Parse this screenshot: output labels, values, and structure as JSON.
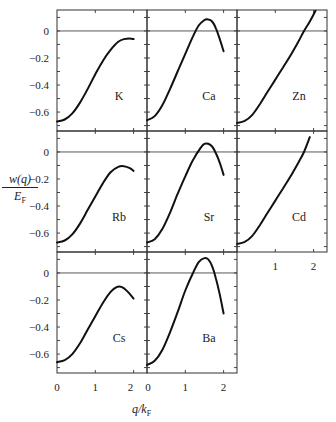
{
  "chart_data": {
    "type": "line",
    "layout": "small-multiples grid (3 columns x 3 rows, Cs and Ba in bottom row, Zn/Cd in third column)",
    "ylabel_num": "w(q)",
    "ylabel_den_main": "E",
    "ylabel_den_sub": "F",
    "xlabel_main": "q/k",
    "xlabel_sub": "F",
    "xlim": [
      0,
      2.35
    ],
    "ylim": [
      -0.74,
      0.155
    ],
    "yticks": [
      0,
      -0.2,
      -0.4,
      -0.6
    ],
    "ytick_labels": [
      "0",
      "−0.2",
      "−0.4",
      "−0.6"
    ],
    "xticks": [
      0,
      1,
      2
    ],
    "xtick_labels": [
      "0",
      "1",
      "2"
    ],
    "zero_line": true,
    "panels": [
      {
        "label": "K",
        "row": 0,
        "col": 0,
        "x": [
          0,
          0.2,
          0.4,
          0.6,
          0.8,
          1.0,
          1.2,
          1.4,
          1.6,
          1.75,
          1.9,
          2.0
        ],
        "y": [
          -0.67,
          -0.655,
          -0.61,
          -0.53,
          -0.43,
          -0.32,
          -0.22,
          -0.14,
          -0.08,
          -0.06,
          -0.055,
          -0.06
        ]
      },
      {
        "label": "Ca",
        "row": 0,
        "col": 1,
        "x": [
          0,
          0.2,
          0.4,
          0.6,
          0.8,
          1.0,
          1.2,
          1.35,
          1.5,
          1.6,
          1.7,
          1.8,
          1.9,
          2.0
        ],
        "y": [
          -0.66,
          -0.63,
          -0.55,
          -0.43,
          -0.3,
          -0.17,
          -0.04,
          0.04,
          0.08,
          0.085,
          0.07,
          0.02,
          -0.06,
          -0.15
        ]
      },
      {
        "label": "Zn",
        "row": 0,
        "col": 2,
        "x": [
          0,
          0.2,
          0.4,
          0.6,
          0.8,
          1.0,
          1.2,
          1.4,
          1.6,
          1.75,
          1.9,
          2.05
        ],
        "y": [
          -0.68,
          -0.665,
          -0.62,
          -0.54,
          -0.45,
          -0.36,
          -0.27,
          -0.18,
          -0.08,
          0.0,
          0.07,
          0.15
        ]
      },
      {
        "label": "Rb",
        "row": 1,
        "col": 0,
        "x": [
          0,
          0.2,
          0.4,
          0.6,
          0.8,
          1.0,
          1.2,
          1.4,
          1.6,
          1.75,
          1.9,
          2.0
        ],
        "y": [
          -0.67,
          -0.655,
          -0.61,
          -0.53,
          -0.43,
          -0.33,
          -0.23,
          -0.15,
          -0.11,
          -0.105,
          -0.12,
          -0.14
        ]
      },
      {
        "label": "Sr",
        "row": 1,
        "col": 1,
        "x": [
          0,
          0.2,
          0.4,
          0.6,
          0.8,
          1.0,
          1.2,
          1.4,
          1.5,
          1.6,
          1.7,
          1.8,
          1.9,
          2.0
        ],
        "y": [
          -0.67,
          -0.645,
          -0.57,
          -0.45,
          -0.31,
          -0.18,
          -0.06,
          0.03,
          0.06,
          0.06,
          0.04,
          -0.01,
          -0.08,
          -0.17
        ]
      },
      {
        "label": "Cd",
        "row": 1,
        "col": 2,
        "x": [
          0,
          0.2,
          0.4,
          0.6,
          0.8,
          1.0,
          1.2,
          1.4,
          1.6,
          1.75,
          1.9
        ],
        "y": [
          -0.68,
          -0.665,
          -0.62,
          -0.54,
          -0.45,
          -0.36,
          -0.27,
          -0.18,
          -0.08,
          0.0,
          0.11
        ]
      },
      {
        "label": "Cs",
        "row": 2,
        "col": 0,
        "x": [
          0,
          0.2,
          0.4,
          0.6,
          0.8,
          1.0,
          1.2,
          1.4,
          1.55,
          1.7,
          1.85,
          2.0
        ],
        "y": [
          -0.66,
          -0.645,
          -0.6,
          -0.52,
          -0.42,
          -0.32,
          -0.22,
          -0.14,
          -0.105,
          -0.105,
          -0.14,
          -0.19
        ]
      },
      {
        "label": "Ba",
        "row": 2,
        "col": 1,
        "x": [
          0,
          0.2,
          0.4,
          0.6,
          0.8,
          1.0,
          1.2,
          1.35,
          1.5,
          1.6,
          1.7,
          1.8,
          1.9,
          2.0
        ],
        "y": [
          -0.68,
          -0.65,
          -0.57,
          -0.44,
          -0.29,
          -0.13,
          0.0,
          0.08,
          0.11,
          0.1,
          0.05,
          -0.04,
          -0.16,
          -0.3
        ]
      }
    ]
  }
}
